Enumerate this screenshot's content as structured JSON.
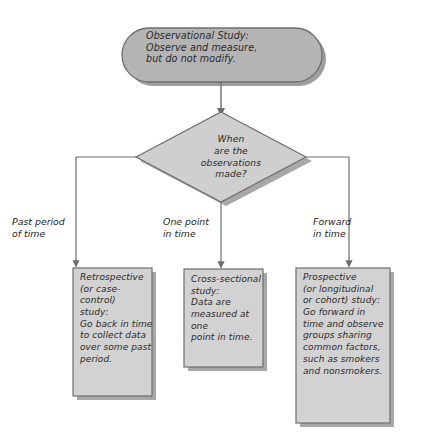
{
  "diagram": {
    "colors": {
      "shape_fill": "#b4b4b4",
      "box_fill": "#d2d2d2",
      "diamond_fill": "#cfcfcf",
      "stroke": "#6e6e6e",
      "shadow": "#9a9a9a",
      "text": "#2a2a2a",
      "background": "#ffffff"
    },
    "start_node": {
      "shape": "rounded-rectangle",
      "text": "Observational Study:\nObserve and measure,\nbut do not modify."
    },
    "decision_node": {
      "shape": "diamond",
      "text": "When\nare the\nobservations\nmade?"
    },
    "edge_labels": [
      {
        "id": "past",
        "text": "Past period\nof time"
      },
      {
        "id": "one-point",
        "text": "One point\nin time"
      },
      {
        "id": "forward",
        "text": "Forward\nin time"
      }
    ],
    "outcome_boxes": [
      {
        "id": "retrospective",
        "shape": "rectangle",
        "text": "Retrospective\n(or case-control)\nstudy:\nGo back in time\nto collect data\nover some past\nperiod."
      },
      {
        "id": "cross-sectional",
        "shape": "rectangle",
        "text": "Cross-sectional\nstudy:\nData are\nmeasured at one\npoint in time."
      },
      {
        "id": "prospective",
        "shape": "rectangle",
        "text": "Prospective\n(or longitudinal\nor cohort) study:\nGo forward in\ntime and observe\ngroups sharing\ncommon factors,\nsuch as smokers\nand nonsmokers."
      }
    ]
  }
}
